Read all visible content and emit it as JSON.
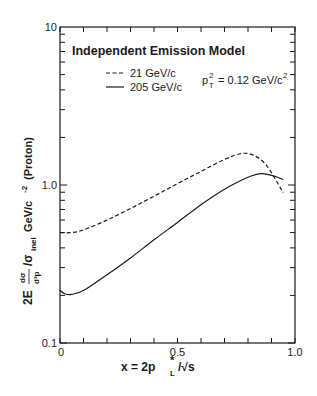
{
  "chart_data": {
    "type": "line",
    "title": "Independent Emission Model",
    "annotation": "p_T^2 = 0.12 GeV/c^2",
    "annotation_parts": {
      "base": "p",
      "sup": "2",
      "sub": "T",
      "rest": " = 0.12 GeV/c",
      "rest_sup": "2"
    },
    "xlabel": "x = 2p*_L/√s",
    "xlabel_parts": {
      "prefix": "x = 2p",
      "sup": "*",
      "sub": "L",
      "suffix": "/√s"
    },
    "ylabel": "2E dσ/d³p /σ_inel GeV/c⁻² (Proton)",
    "ylabel_parts": {
      "prefix": "2E",
      "frac_num": "dσ",
      "frac_den": "d³p",
      "mid": "/σ",
      "sub": "inel",
      "unit": " GeV/c",
      "unit_sup": "-2",
      "suffix": " (Proton)"
    },
    "xlim": [
      0,
      1.0
    ],
    "ylim": [
      0.1,
      10
    ],
    "yscale": "log",
    "x_ticks": [
      0,
      0.5,
      1.0
    ],
    "x_tick_labels": [
      "0",
      "0.5",
      "1.0"
    ],
    "y_ticks": [
      0.1,
      1.0,
      10
    ],
    "y_tick_labels": [
      "0.1",
      "1.0",
      "10"
    ],
    "grid": false,
    "legend_position": "upper-left",
    "series": [
      {
        "name": "21 GeV/c",
        "style": "dashed",
        "x": [
          0.0,
          0.05,
          0.1,
          0.2,
          0.3,
          0.4,
          0.5,
          0.6,
          0.7,
          0.77,
          0.82,
          0.87,
          0.91,
          0.95
        ],
        "values": [
          0.5,
          0.5,
          0.52,
          0.6,
          0.71,
          0.85,
          1.02,
          1.22,
          1.45,
          1.58,
          1.55,
          1.38,
          1.13,
          0.89
        ]
      },
      {
        "name": "205 GeV/c",
        "style": "solid",
        "x": [
          0.0,
          0.02,
          0.05,
          0.1,
          0.2,
          0.3,
          0.4,
          0.5,
          0.6,
          0.7,
          0.8,
          0.86,
          0.91,
          0.95
        ],
        "values": [
          0.216,
          0.205,
          0.203,
          0.215,
          0.27,
          0.345,
          0.45,
          0.58,
          0.75,
          0.94,
          1.12,
          1.18,
          1.14,
          1.08
        ]
      }
    ]
  }
}
